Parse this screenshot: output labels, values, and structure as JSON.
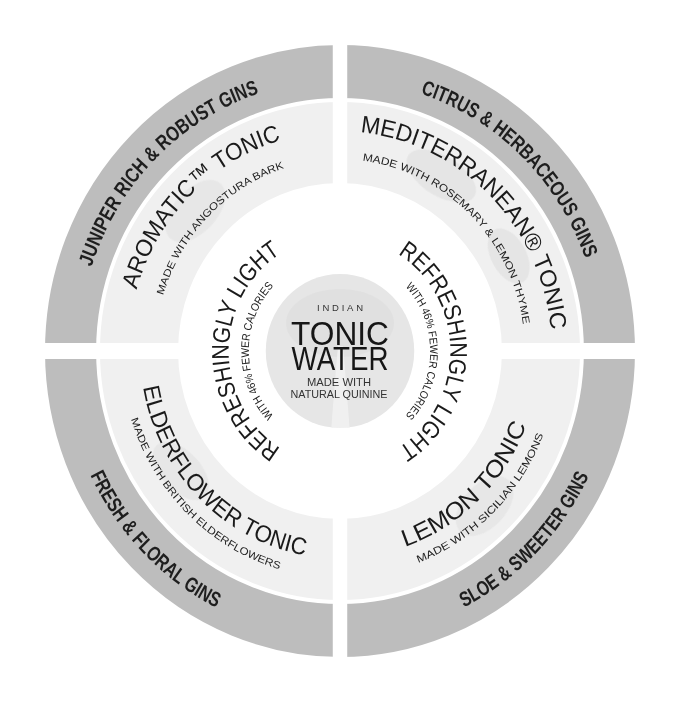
{
  "wheel": {
    "center": {
      "eyebrow": "INDIAN",
      "title_line1": "TONIC",
      "title_line2": "WATER",
      "subtitle_line1": "MADE WITH",
      "subtitle_line2": "NATURAL QUININE"
    },
    "inner_ring": {
      "left": {
        "title": "REFRESHINGLY LIGHT",
        "subtitle": "WITH 46% FEWER CALORIES"
      },
      "right": {
        "title": "REFRESHINGLY LIGHT",
        "subtitle": "WITH 46% FEWER CALORIES"
      }
    },
    "quadrants": {
      "top_left": {
        "gin_category": "JUNIPER RICH & ROBUST GINS",
        "tonic": "AROMATIC™ TONIC",
        "ingredient": "MADE WITH ANGOSTURA BARK"
      },
      "top_right": {
        "gin_category": "CITRUS & HERBACEOUS GINS",
        "tonic": "MEDITERRANEAN® TONIC",
        "ingredient": "MADE WITH ROSEMARY & LEMON THYME"
      },
      "bottom_left": {
        "gin_category": "FRESH & FLORAL GINS",
        "tonic": "ELDERFLOWER TONIC",
        "ingredient": "MADE WITH BRITISH ELDERFLOWERS"
      },
      "bottom_right": {
        "gin_category": "SLOE & SWEETER GINS",
        "tonic": "LEMON TONIC",
        "ingredient": "MADE WITH SICILIAN LEMONS"
      }
    },
    "colors": {
      "background": "#ffffff",
      "outer_ring": "#bdbdbd",
      "inner_ring": "#f0f0f0",
      "center_disc": "#e6e6e6",
      "text": "#1a1a1a"
    }
  }
}
